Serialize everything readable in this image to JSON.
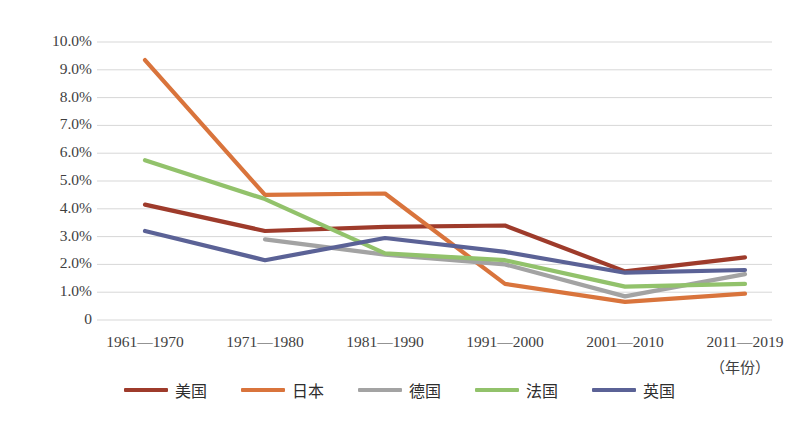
{
  "chart_data": {
    "type": "line",
    "title": "",
    "xlabel": "（年份）",
    "ylabel": "",
    "grid": true,
    "legend_position": "bottom",
    "ylim": [
      0,
      10
    ],
    "ytick_labels": [
      "10.0%",
      "9.0%",
      "8.0%",
      "7.0%",
      "6.0%",
      "5.0%",
      "4.0%",
      "3.0%",
      "2.0%",
      "1.0%",
      "0"
    ],
    "ytick_values": [
      10,
      9,
      8,
      7,
      6,
      5,
      4,
      3,
      2,
      1,
      0
    ],
    "categories": [
      "1961—1970",
      "1971—1980",
      "1981—1990",
      "1991—2000",
      "2001—2010",
      "2011—2019"
    ],
    "series": [
      {
        "name": "美国",
        "color": "#9E3B2B",
        "values": [
          4.15,
          3.2,
          3.35,
          3.4,
          1.75,
          2.25
        ]
      },
      {
        "name": "日本",
        "color": "#D9743C",
        "values": [
          9.35,
          4.5,
          4.55,
          1.3,
          0.65,
          0.95
        ]
      },
      {
        "name": "德国",
        "color": "#A3A3A3",
        "values": [
          null,
          2.9,
          2.35,
          2.0,
          0.85,
          1.65
        ]
      },
      {
        "name": "法国",
        "color": "#92C26B",
        "values": [
          5.75,
          4.35,
          2.4,
          2.15,
          1.2,
          1.3
        ]
      },
      {
        "name": "英国",
        "color": "#5B6296",
        "values": [
          3.2,
          2.15,
          2.95,
          2.45,
          1.7,
          1.8
        ]
      }
    ]
  },
  "axis_note": "（年份）",
  "legend": {
    "items": [
      {
        "label": "美国",
        "color": "#9E3B2B"
      },
      {
        "label": "日本",
        "color": "#D9743C"
      },
      {
        "label": "德国",
        "color": "#A3A3A3"
      },
      {
        "label": "法国",
        "color": "#92C26B"
      },
      {
        "label": "英国",
        "color": "#5B6296"
      }
    ]
  },
  "colors": {
    "gridline": "#D7D7D7",
    "text": "#3f3f3f",
    "background": "#ffffff"
  }
}
